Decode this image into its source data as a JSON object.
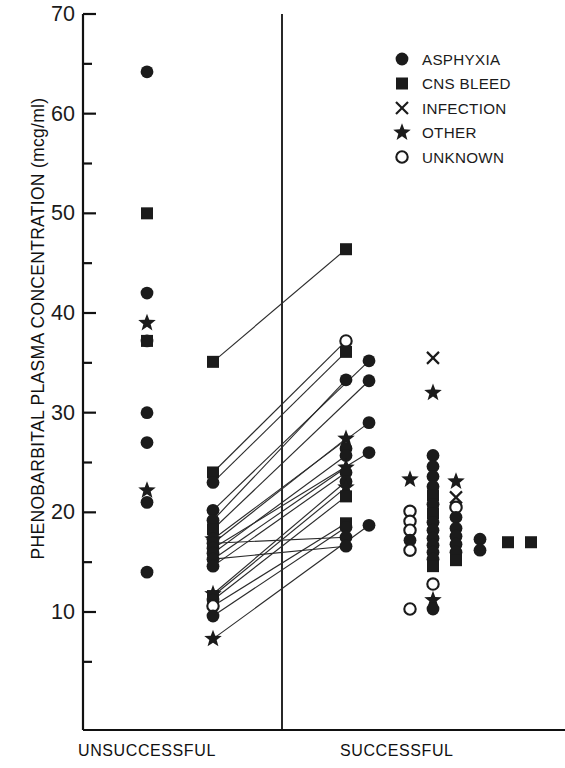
{
  "axes": {
    "y_title": "PHENOBARBITAL PLASMA CONCENTRATION (mcg/ml)",
    "y_ticks_major": [
      70,
      60,
      50,
      40,
      30,
      20,
      10
    ],
    "y_ticks_minor": [
      65,
      55,
      45,
      35,
      25,
      15,
      5
    ],
    "y_min": 3.0,
    "y_max": 70.0,
    "x_categories": [
      "UNSUCCESSFUL",
      "SUCCESSFUL"
    ]
  },
  "legend": {
    "items": [
      {
        "label": "ASPHYXIA",
        "marker": "filled-circle"
      },
      {
        "label": "CNS BLEED",
        "marker": "filled-square"
      },
      {
        "label": "INFECTION",
        "marker": "cross"
      },
      {
        "label": "OTHER",
        "marker": "star"
      },
      {
        "label": "UNKNOWN",
        "marker": "open-circle"
      }
    ]
  },
  "chart_data": {
    "type": "scatter",
    "title": "",
    "xlabel": "",
    "ylabel": "PHENOBARBITAL PLASMA CONCENTRATION (mcg/ml)",
    "ylim": [
      3,
      70
    ],
    "grid": false,
    "legend_position": "top-right",
    "group_labels": [
      "UNSUCCESSFUL",
      "SUCCESSFUL"
    ],
    "marker_legend": {
      "filled-circle": "ASPHYXIA",
      "filled-square": "CNS BLEED",
      "cross": "INFECTION",
      "star": "OTHER",
      "open-circle": "UNKNOWN"
    },
    "columns": [
      {
        "name": "unsuccessful-singletons",
        "x_px": 147,
        "group": "UNSUCCESSFUL",
        "points": [
          {
            "y": 64.2,
            "marker": "filled-circle"
          },
          {
            "y": 50.0,
            "marker": "filled-square"
          },
          {
            "y": 42.0,
            "marker": "filled-circle"
          },
          {
            "y": 39.0,
            "marker": "star"
          },
          {
            "y": 37.2,
            "marker": "filled-circle"
          },
          {
            "y": 37.2,
            "marker": "filled-square"
          },
          {
            "y": 30.0,
            "marker": "filled-circle"
          },
          {
            "y": 27.0,
            "marker": "filled-circle"
          },
          {
            "y": 22.2,
            "marker": "star"
          },
          {
            "y": 21.0,
            "marker": "filled-circle"
          },
          {
            "y": 14.0,
            "marker": "filled-circle"
          }
        ]
      },
      {
        "name": "unsuccessful-paired",
        "x_px": 213,
        "group": "UNSUCCESSFUL",
        "points": [
          {
            "y": 35.1,
            "marker": "filled-square"
          },
          {
            "y": 24.0,
            "marker": "filled-square"
          },
          {
            "y": 23.0,
            "marker": "filled-circle"
          },
          {
            "y": 20.2,
            "marker": "filled-circle"
          },
          {
            "y": 19.2,
            "marker": "filled-circle"
          },
          {
            "y": 18.3,
            "marker": "filled-square"
          },
          {
            "y": 17.3,
            "marker": "star"
          },
          {
            "y": 17.3,
            "marker": "filled-circle"
          },
          {
            "y": 16.9,
            "marker": "filled-circle"
          },
          {
            "y": 16.4,
            "marker": "filled-circle"
          },
          {
            "y": 15.9,
            "marker": "filled-circle"
          },
          {
            "y": 15.3,
            "marker": "filled-circle"
          },
          {
            "y": 14.6,
            "marker": "filled-circle"
          },
          {
            "y": 11.8,
            "marker": "star"
          },
          {
            "y": 11.6,
            "marker": "filled-square"
          },
          {
            "y": 11.2,
            "marker": "filled-circle"
          },
          {
            "y": 10.6,
            "marker": "open-circle"
          },
          {
            "y": 9.6,
            "marker": "filled-circle"
          },
          {
            "y": 7.3,
            "marker": "star"
          }
        ]
      },
      {
        "name": "successful-paired",
        "x_px": 346,
        "group": "SUCCESSFUL",
        "points": [
          {
            "y": 46.4,
            "marker": "filled-square"
          },
          {
            "y": 37.2,
            "marker": "open-circle"
          },
          {
            "y": 36.1,
            "marker": "filled-square"
          },
          {
            "y": 33.3,
            "marker": "filled-circle"
          },
          {
            "y": 27.4,
            "marker": "star"
          },
          {
            "y": 26.4,
            "marker": "filled-circle"
          },
          {
            "y": 25.7,
            "marker": "filled-circle"
          },
          {
            "y": 24.5,
            "marker": "star"
          },
          {
            "y": 24.0,
            "marker": "filled-circle"
          },
          {
            "y": 23.1,
            "marker": "filled-circle"
          },
          {
            "y": 22.5,
            "marker": "star"
          },
          {
            "y": 21.6,
            "marker": "filled-square"
          },
          {
            "y": 18.9,
            "marker": "filled-square"
          },
          {
            "y": 18.5,
            "marker": "filled-circle"
          },
          {
            "y": 17.5,
            "marker": "filled-circle"
          },
          {
            "y": 16.6,
            "marker": "filled-circle"
          }
        ]
      },
      {
        "name": "successful-paired-offset",
        "x_px": 369,
        "group": "SUCCESSFUL",
        "points": [
          {
            "y": 35.2,
            "marker": "filled-circle"
          },
          {
            "y": 33.2,
            "marker": "filled-circle"
          },
          {
            "y": 29.0,
            "marker": "filled-circle"
          },
          {
            "y": 26.0,
            "marker": "filled-circle"
          },
          {
            "y": 18.7,
            "marker": "filled-circle"
          }
        ]
      },
      {
        "name": "successful-col-3",
        "x_px": 410,
        "group": "SUCCESSFUL",
        "points": [
          {
            "y": 23.3,
            "marker": "star"
          },
          {
            "y": 20.1,
            "marker": "open-circle"
          },
          {
            "y": 19.1,
            "marker": "open-circle"
          },
          {
            "y": 18.2,
            "marker": "open-circle"
          },
          {
            "y": 17.2,
            "marker": "filled-circle"
          },
          {
            "y": 16.2,
            "marker": "open-circle"
          },
          {
            "y": 10.3,
            "marker": "open-circle"
          }
        ]
      },
      {
        "name": "successful-col-4",
        "x_px": 433,
        "group": "SUCCESSFUL",
        "points": [
          {
            "y": 35.5,
            "marker": "cross"
          },
          {
            "y": 32.0,
            "marker": "star"
          },
          {
            "y": 25.7,
            "marker": "filled-circle"
          },
          {
            "y": 24.6,
            "marker": "filled-circle"
          },
          {
            "y": 23.6,
            "marker": "filled-circle"
          },
          {
            "y": 22.6,
            "marker": "filled-circle"
          },
          {
            "y": 21.7,
            "marker": "filled-square"
          },
          {
            "y": 20.8,
            "marker": "filled-circle"
          },
          {
            "y": 19.9,
            "marker": "filled-square"
          },
          {
            "y": 19.0,
            "marker": "filled-circle"
          },
          {
            "y": 18.2,
            "marker": "filled-circle"
          },
          {
            "y": 17.4,
            "marker": "filled-circle"
          },
          {
            "y": 16.7,
            "marker": "filled-circle"
          },
          {
            "y": 16.0,
            "marker": "filled-circle"
          },
          {
            "y": 15.3,
            "marker": "filled-circle"
          },
          {
            "y": 14.6,
            "marker": "filled-square"
          },
          {
            "y": 12.8,
            "marker": "open-circle"
          },
          {
            "y": 11.2,
            "marker": "star"
          },
          {
            "y": 10.3,
            "marker": "filled-circle"
          }
        ]
      },
      {
        "name": "successful-col-5",
        "x_px": 456,
        "group": "SUCCESSFUL",
        "points": [
          {
            "y": 23.1,
            "marker": "star"
          },
          {
            "y": 21.5,
            "marker": "cross"
          },
          {
            "y": 20.5,
            "marker": "open-circle"
          },
          {
            "y": 19.5,
            "marker": "filled-circle"
          },
          {
            "y": 18.4,
            "marker": "filled-circle"
          },
          {
            "y": 17.6,
            "marker": "filled-circle"
          },
          {
            "y": 16.8,
            "marker": "filled-circle"
          },
          {
            "y": 16.0,
            "marker": "filled-circle"
          },
          {
            "y": 15.2,
            "marker": "filled-square"
          }
        ]
      },
      {
        "name": "successful-col-6",
        "x_px": 480,
        "group": "SUCCESSFUL",
        "points": [
          {
            "y": 17.3,
            "marker": "filled-circle"
          },
          {
            "y": 16.2,
            "marker": "filled-circle"
          }
        ]
      },
      {
        "name": "successful-col-7",
        "x_px": 508,
        "group": "SUCCESSFUL",
        "points": [
          {
            "y": 17.0,
            "marker": "filled-square"
          }
        ]
      },
      {
        "name": "successful-col-8",
        "x_px": 531,
        "group": "SUCCESSFUL",
        "points": [
          {
            "y": 17.0,
            "marker": "filled-square"
          }
        ]
      }
    ],
    "pairs": [
      {
        "from": {
          "x_px": 213,
          "y": 35.1
        },
        "to": {
          "x_px": 346,
          "y": 46.4
        }
      },
      {
        "from": {
          "x_px": 213,
          "y": 24.0
        },
        "to": {
          "x_px": 346,
          "y": 37.2
        }
      },
      {
        "from": {
          "x_px": 213,
          "y": 23.0
        },
        "to": {
          "x_px": 346,
          "y": 36.1
        }
      },
      {
        "from": {
          "x_px": 213,
          "y": 20.2
        },
        "to": {
          "x_px": 369,
          "y": 35.2
        }
      },
      {
        "from": {
          "x_px": 213,
          "y": 19.2
        },
        "to": {
          "x_px": 346,
          "y": 33.3
        }
      },
      {
        "from": {
          "x_px": 213,
          "y": 18.3
        },
        "to": {
          "x_px": 369,
          "y": 33.2
        }
      },
      {
        "from": {
          "x_px": 213,
          "y": 17.3
        },
        "to": {
          "x_px": 369,
          "y": 29.0
        }
      },
      {
        "from": {
          "x_px": 213,
          "y": 16.9
        },
        "to": {
          "x_px": 346,
          "y": 27.4
        }
      },
      {
        "from": {
          "x_px": 213,
          "y": 16.4
        },
        "to": {
          "x_px": 369,
          "y": 26.0
        }
      },
      {
        "from": {
          "x_px": 213,
          "y": 15.9
        },
        "to": {
          "x_px": 346,
          "y": 25.7
        }
      },
      {
        "from": {
          "x_px": 213,
          "y": 15.3
        },
        "to": {
          "x_px": 346,
          "y": 24.5
        }
      },
      {
        "from": {
          "x_px": 213,
          "y": 14.6
        },
        "to": {
          "x_px": 346,
          "y": 24.0
        }
      },
      {
        "from": {
          "x_px": 213,
          "y": 11.8
        },
        "to": {
          "x_px": 346,
          "y": 23.1
        }
      },
      {
        "from": {
          "x_px": 213,
          "y": 11.6
        },
        "to": {
          "x_px": 346,
          "y": 22.5
        }
      },
      {
        "from": {
          "x_px": 213,
          "y": 11.2
        },
        "to": {
          "x_px": 346,
          "y": 21.6
        }
      },
      {
        "from": {
          "x_px": 213,
          "y": 10.6
        },
        "to": {
          "x_px": 346,
          "y": 18.9
        }
      },
      {
        "from": {
          "x_px": 213,
          "y": 9.6
        },
        "to": {
          "x_px": 346,
          "y": 18.5
        }
      },
      {
        "from": {
          "x_px": 213,
          "y": 7.3
        },
        "to": {
          "x_px": 369,
          "y": 18.7
        }
      },
      {
        "from": {
          "x_px": 213,
          "y": 16.9
        },
        "to": {
          "x_px": 346,
          "y": 17.5
        }
      },
      {
        "from": {
          "x_px": 213,
          "y": 15.3
        },
        "to": {
          "x_px": 346,
          "y": 16.6
        }
      }
    ]
  },
  "style": {
    "ink": "#1b1b1b",
    "axis": "#111111",
    "line": "#2b2b2b"
  }
}
